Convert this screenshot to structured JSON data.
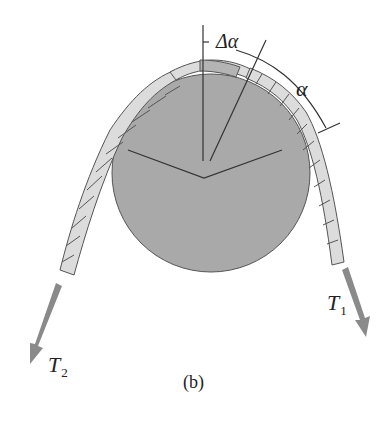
{
  "figure": {
    "caption": "(b)",
    "labels": {
      "delta_alpha": "Δα",
      "alpha": "α",
      "t1_main": "T",
      "t1_sub": "1",
      "t2_main": "T",
      "t2_sub": "2"
    },
    "colors": {
      "pulley_fill": "#a9a9a9",
      "rope_fill": "#dcdcdc",
      "rope_element_fill": "#b4b4b4",
      "arrow": "#8a8a8a",
      "line": "#333333"
    }
  }
}
